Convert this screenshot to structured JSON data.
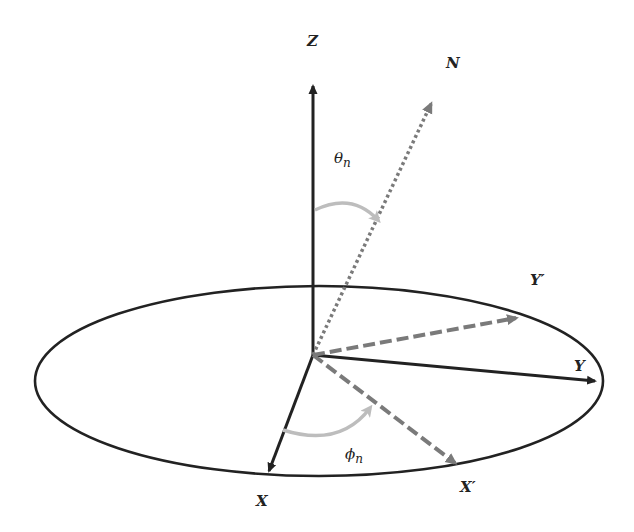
{
  "diagram": {
    "type": "coordinate-system-rotation",
    "colors": {
      "axis": "#222222",
      "rotated_axis": "#7a7a7a",
      "normal_vector": "#7a7a7a",
      "angle_arc": "#bdbdbd",
      "plane_ellipse": "#222222",
      "background": "#ffffff"
    },
    "labels": {
      "z": "Z",
      "n": "N",
      "y_prime": "Y′",
      "y": "Y",
      "x": "X",
      "x_prime": "X′",
      "theta_base": "θ",
      "theta_sub": "n",
      "phi_base": "ϕ",
      "phi_sub": "n"
    },
    "elements": [
      {
        "name": "Z axis",
        "style": "solid",
        "from": [
          313,
          355
        ],
        "to": [
          313,
          80
        ]
      },
      {
        "name": "N vector",
        "style": "dotted",
        "from": [
          313,
          355
        ],
        "to": [
          434,
          98
        ]
      },
      {
        "name": "Y axis",
        "style": "solid",
        "from": [
          313,
          355
        ],
        "to": [
          601,
          382
        ]
      },
      {
        "name": "Y' axis",
        "style": "dashed",
        "from": [
          313,
          355
        ],
        "to": [
          523,
          317
        ]
      },
      {
        "name": "X axis",
        "style": "solid",
        "from": [
          313,
          355
        ],
        "to": [
          267,
          477
        ]
      },
      {
        "name": "X' axis",
        "style": "dashed",
        "from": [
          313,
          355
        ],
        "to": [
          461,
          468
        ]
      },
      {
        "name": "theta_n arc",
        "style": "arc",
        "from": "Z axis",
        "to": "N vector"
      },
      {
        "name": "phi_n arc",
        "style": "arc",
        "from": "X axis",
        "to": "X' axis"
      },
      {
        "name": "XY plane",
        "style": "ellipse",
        "center": [
          319,
          381
        ],
        "rx": 284,
        "ry": 95
      }
    ]
  }
}
